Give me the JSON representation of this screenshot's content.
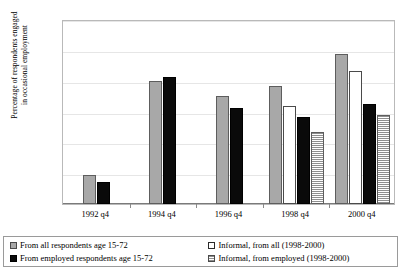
{
  "chart_data": {
    "type": "bar",
    "title": "",
    "subtitle": "",
    "xlabel": "",
    "ylabel": "Percentage of respondents engaged in occasional employment",
    "ylabel_lines": [
      "Percentage of respondents engaged",
      "in occasional employment"
    ],
    "categories": [
      "1992 q4",
      "1994 q4",
      "1996 q4",
      "1998 q4",
      "2000 q4"
    ],
    "ylim": [
      0,
      12
    ],
    "ytick_values": [
      0,
      2,
      4,
      6,
      8,
      10,
      12
    ],
    "ytick_labels": [
      "0%",
      "2%",
      "4%",
      "6%",
      "8%",
      "10%",
      "12%"
    ],
    "ytick_format": "percent",
    "grid": true,
    "grid_axis": "y",
    "legend_position": "bottom",
    "bar_order_in_group": [
      "all_respondents",
      "informal_all",
      "employed_respondents",
      "informal_employed"
    ],
    "series": [
      {
        "name": "From all respondents age 15-72",
        "key": "all_respondents",
        "style": "solid-gray",
        "color": "#a8a8a8",
        "values": [
          1.9,
          8.0,
          7.0,
          7.65,
          9.7
        ]
      },
      {
        "name": "Informal, from all (1998-2000)",
        "key": "informal_all",
        "style": "solid-white",
        "color": "#ffffff",
        "values": [
          null,
          null,
          null,
          6.35,
          8.6
        ]
      },
      {
        "name": "From employed respondents age 15-72",
        "key": "employed_respondents",
        "style": "solid-black",
        "color": "#0a0a0a",
        "values": [
          1.45,
          8.25,
          6.2,
          5.65,
          6.5
        ]
      },
      {
        "name": "Informal, from employed (1998-2000)",
        "key": "informal_employed",
        "style": "hatched-horizontal",
        "color": "#8f8f8f",
        "values": [
          null,
          null,
          null,
          4.7,
          5.8
        ]
      }
    ]
  }
}
